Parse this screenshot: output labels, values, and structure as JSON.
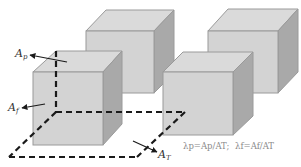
{
  "diagram": {
    "colors": {
      "front_face": "#d3d3d3",
      "top_face": "#dadada",
      "side_face": "#a9a9a9",
      "edge": "#9a9a9a",
      "dashed": "#1a1a1a",
      "arrow": "#1a1a1a",
      "label": "#333333",
      "formula": "#8a8a8a"
    },
    "cubes": [
      {
        "name": "back-left-cube",
        "front": [
          86,
          31,
          154,
          93
        ],
        "depth": [
          20,
          -21
        ]
      },
      {
        "name": "back-right-cube",
        "front": [
          208,
          31,
          278,
          93
        ],
        "depth": [
          20,
          -22
        ]
      },
      {
        "name": "front-left-cube",
        "front": [
          33,
          72,
          103,
          145
        ],
        "depth": [
          19,
          -21
        ]
      },
      {
        "name": "front-right-cube",
        "front": [
          163,
          72,
          233,
          135
        ],
        "depth": [
          20,
          -20
        ]
      }
    ],
    "labels": {
      "plan_area": {
        "base": "A",
        "sub": "p"
      },
      "frontal_area": {
        "base": "A",
        "sub": "f"
      },
      "total_area": {
        "base": "A",
        "sub": "T"
      },
      "formula": {
        "lambda_p": "λp=Ap/AT;",
        "lambda_f": "λf=Af/AT"
      }
    }
  }
}
